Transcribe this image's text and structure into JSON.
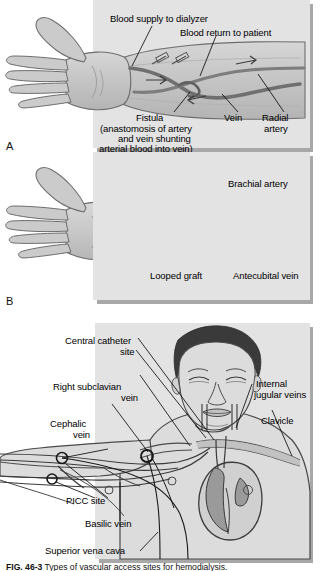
{
  "figure": {
    "caption_number": "FIG. 46-3",
    "caption_text": "Types of vascular access sites for hemodialysis.",
    "background_color": "#ffffff",
    "panel_color": "#e3e3e3",
    "shadow_color": "#a8a8a8",
    "skin_color": "#c9c9c9",
    "vessel_color": "#8a8a8a",
    "artery_color": "#707070",
    "hair_color": "#3a3a3a",
    "heart_color": "#9a9a9a"
  },
  "panel_a": {
    "letter": "A",
    "labels": [
      {
        "id": "blood-supply-to-dialyzer",
        "text": "Blood supply to dialyzer"
      },
      {
        "id": "blood-return-to-patient",
        "text": "Blood return to patient"
      },
      {
        "id": "fistula",
        "text": "Fistula"
      },
      {
        "id": "fistula-note-1",
        "text": "(anastomosis of artery"
      },
      {
        "id": "fistula-note-2",
        "text": "and vein shunting"
      },
      {
        "id": "fistula-note-3",
        "text": "arterial blood into vein)"
      },
      {
        "id": "vein",
        "text": "Vein"
      },
      {
        "id": "radial-artery-1",
        "text": "Radial"
      },
      {
        "id": "radial-artery-2",
        "text": "artery"
      }
    ]
  },
  "panel_b": {
    "letter": "B",
    "labels": [
      {
        "id": "brachial-artery",
        "text": "Brachial artery"
      },
      {
        "id": "looped-graft",
        "text": "Looped graft"
      },
      {
        "id": "antecubital-vein",
        "text": "Antecubital vein"
      }
    ]
  },
  "panel_c": {
    "labels": [
      {
        "id": "central-catheter-site-1",
        "text": "Central catheter"
      },
      {
        "id": "central-catheter-site-2",
        "text": "site"
      },
      {
        "id": "right-subclavian-vein-1",
        "text": "Right subclavian"
      },
      {
        "id": "right-subclavian-vein-2",
        "text": "vein"
      },
      {
        "id": "cephalic-vein-1",
        "text": "Cephalic"
      },
      {
        "id": "cephalic-vein-2",
        "text": "vein"
      },
      {
        "id": "picc-site",
        "text": "PICC site"
      },
      {
        "id": "basilic-vein",
        "text": "Basilic vein"
      },
      {
        "id": "superior-vena-cava",
        "text": "Superior vena cava"
      },
      {
        "id": "internal-jugular-veins-1",
        "text": "Internal"
      },
      {
        "id": "internal-jugular-veins-2",
        "text": "jugular veins"
      },
      {
        "id": "clavicle",
        "text": "Clavicle"
      }
    ]
  }
}
